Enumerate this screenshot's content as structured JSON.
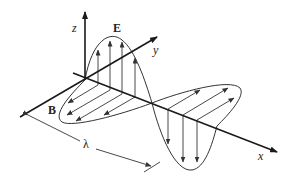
{
  "diagram": {
    "labels": {
      "z_axis": "z",
      "y_axis": "y",
      "x_axis": "x",
      "electric_field": "E",
      "magnetic_field": "B",
      "wavelength": "λ"
    },
    "colors": {
      "line": "#1a1a1a",
      "background": "#ffffff"
    }
  }
}
